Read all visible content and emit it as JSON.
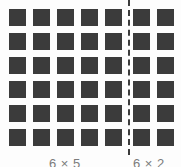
{
  "diagram": {
    "colors": {
      "square": "#3b3b3b",
      "background": "#fdfdfd",
      "divider": "#3b3b3b",
      "label_text": "#7b7b7b"
    },
    "grid": {
      "rows": 6,
      "columns": 7,
      "square_size_px": 17,
      "column_gap_px": 7,
      "row_gap_px": 7,
      "origin_x_px": 9,
      "origin_y_px": 9
    },
    "divider": {
      "x_px": 128,
      "style": "dashed",
      "orientation": "vertical"
    },
    "groups": [
      {
        "name": "left-group",
        "rows": 6,
        "columns": 5,
        "label": "6 × 5",
        "total": 30
      },
      {
        "name": "right-group",
        "rows": 6,
        "columns": 2,
        "label": "6 × 2",
        "total": 12
      }
    ]
  }
}
